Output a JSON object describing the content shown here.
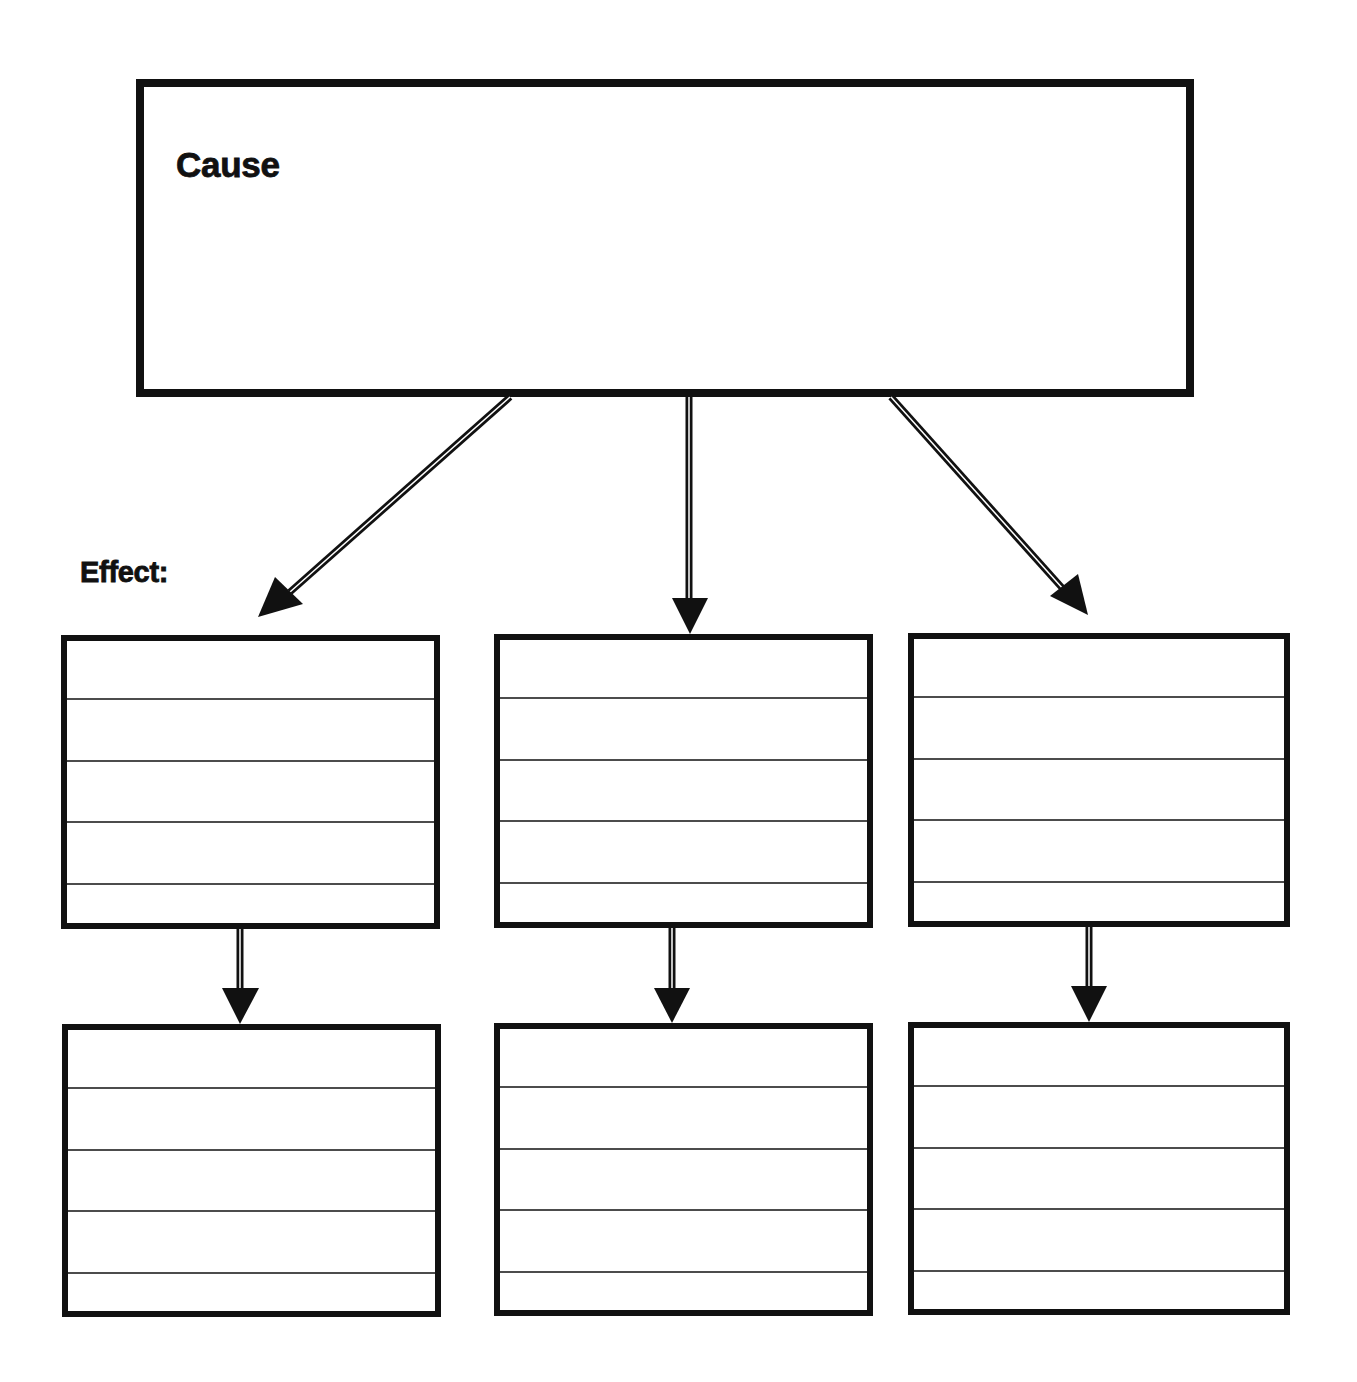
{
  "diagram": {
    "type": "cause-and-effect graphic organizer",
    "cause": {
      "label": "Cause",
      "text": ""
    },
    "effect_label": "Effect:",
    "columns": [
      {
        "effect": {
          "lines": [
            "",
            "",
            "",
            "",
            ""
          ]
        },
        "followup": {
          "lines": [
            "",
            "",
            "",
            "",
            ""
          ]
        }
      },
      {
        "effect": {
          "lines": [
            "",
            "",
            "",
            "",
            ""
          ]
        },
        "followup": {
          "lines": [
            "",
            "",
            "",
            "",
            ""
          ]
        }
      },
      {
        "effect": {
          "lines": [
            "",
            "",
            "",
            "",
            ""
          ]
        },
        "followup": {
          "lines": [
            "",
            "",
            "",
            "",
            ""
          ]
        }
      }
    ],
    "colors": {
      "stroke": "#111111",
      "background": "#ffffff"
    }
  }
}
